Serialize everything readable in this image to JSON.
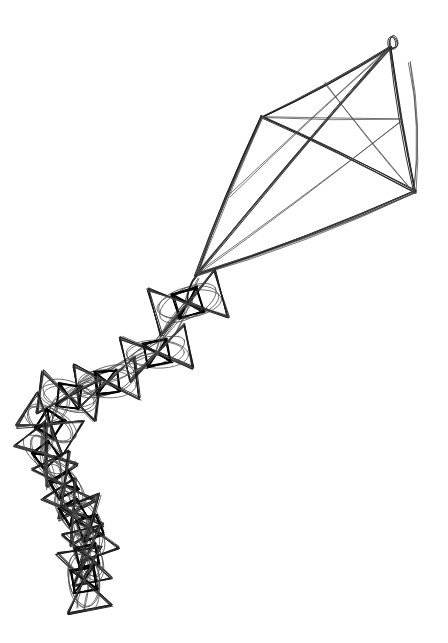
{
  "canvas": {
    "width": 448,
    "height": 643,
    "background_color": "#ffffff",
    "ink_color": "#1a1a1a",
    "ink_color_light": "#4a4a4a",
    "ink_color_dark": "#000000",
    "title": "Kite with knotted tail",
    "style": "sketch line drawing, multiple overlapping passes"
  },
  "chart_data": {
    "type": "line",
    "xlabel": "",
    "ylabel": "",
    "xlim": [
      0,
      448
    ],
    "ylim": [
      0,
      643
    ],
    "grid": false,
    "legend": "none",
    "series": [
      {
        "name": "kite-sail-outline",
        "points": [
          [
            390,
            48
          ],
          [
            262,
            117
          ],
          [
            196,
            275
          ],
          [
            415,
            192
          ],
          [
            390,
            48
          ]
        ]
      },
      {
        "name": "kite-spar-vertical",
        "points": [
          [
            390,
            48
          ],
          [
            196,
            275
          ]
        ]
      },
      {
        "name": "kite-spar-horizontal",
        "points": [
          [
            262,
            117
          ],
          [
            415,
            192
          ]
        ]
      },
      {
        "name": "bridle-lines",
        "points": [
          [
            390,
            48
          ],
          [
            196,
            275
          ],
          [
            262,
            117
          ],
          [
            196,
            275
          ],
          [
            415,
            192
          ],
          [
            196,
            275
          ]
        ]
      },
      {
        "name": "tail-spine",
        "points": [
          [
            196,
            278
          ],
          [
            188,
            303
          ],
          [
            160,
            340
          ],
          [
            140,
            352
          ],
          [
            105,
            372
          ],
          [
            80,
            384
          ],
          [
            58,
            400
          ],
          [
            46,
            424
          ],
          [
            44,
            452
          ],
          [
            52,
            478
          ],
          [
            66,
            498
          ],
          [
            78,
            520
          ],
          [
            88,
            545
          ],
          [
            86,
            568
          ],
          [
            84,
            592
          ],
          [
            80,
            608
          ]
        ]
      }
    ],
    "kite_vertices": {
      "apex": [
        390,
        48
      ],
      "left_wing": [
        262,
        117
      ],
      "right_wing": [
        415,
        192
      ],
      "nose": [
        196,
        275
      ]
    },
    "tail_knots": [
      {
        "index": 1,
        "center": [
          188,
          303
        ],
        "half_width": 34,
        "half_height": 24,
        "angle_deg": -16
      },
      {
        "index": 2,
        "center": [
          157,
          353
        ],
        "half_width": 32,
        "half_height": 22,
        "angle_deg": -12
      },
      {
        "index": 3,
        "center": [
          107,
          382
        ],
        "half_width": 30,
        "half_height": 21,
        "angle_deg": -8
      },
      {
        "index": 4,
        "center": [
          69,
          396
        ],
        "half_width": 29,
        "half_height": 21,
        "angle_deg": 8
      },
      {
        "index": 5,
        "center": [
          50,
          424
        ],
        "half_width": 27,
        "half_height": 20,
        "angle_deg": 32
      },
      {
        "index": 6,
        "center": [
          46,
          455
        ],
        "half_width": 26,
        "half_height": 19,
        "angle_deg": 52
      },
      {
        "index": 7,
        "center": [
          64,
          485
        ],
        "half_width": 28,
        "half_height": 20,
        "angle_deg": 62
      },
      {
        "index": 8,
        "center": [
          73,
          512
        ],
        "half_width": 27,
        "half_height": 19,
        "angle_deg": 58
      },
      {
        "index": 9,
        "center": [
          90,
          528
        ],
        "half_width": 28,
        "half_height": 20,
        "angle_deg": 70
      },
      {
        "index": 10,
        "center": [
          87,
          556
        ],
        "half_width": 26,
        "half_height": 19,
        "angle_deg": 78
      },
      {
        "index": 11,
        "center": [
          84,
          580
        ],
        "half_width": 30,
        "half_height": 22,
        "angle_deg": 80
      }
    ],
    "counts": {
      "knots": 11,
      "sail_panels": 4,
      "bridle_lines": 3
    }
  }
}
